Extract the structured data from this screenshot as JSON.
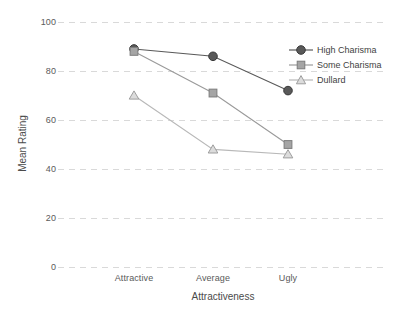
{
  "chart_data": {
    "type": "line",
    "title": "",
    "xlabel": "Attractiveness",
    "ylabel": "Mean Rating",
    "categories": [
      "Attractive",
      "Average",
      "Ugly"
    ],
    "ylim": [
      0,
      100
    ],
    "yticks": [
      0,
      20,
      40,
      60,
      80,
      100
    ],
    "grid": true,
    "legend_position": "top-right",
    "series": [
      {
        "name": "High Charisma",
        "marker": "circle-filled",
        "color": "#595959",
        "values": [
          89,
          86,
          72
        ]
      },
      {
        "name": "Some Charisma",
        "marker": "square-filled",
        "color": "#9a9a9a",
        "values": [
          88,
          71,
          50
        ]
      },
      {
        "name": "Dullard",
        "marker": "triangle-open",
        "color": "#b8b8b8",
        "values": [
          70,
          48,
          46
        ]
      }
    ]
  },
  "axes": {
    "y_tick_labels": [
      "100",
      "80",
      "60",
      "40",
      "20",
      "0"
    ],
    "x_tick_labels": [
      "Attractive",
      "Average",
      "Ugly"
    ],
    "y_title": "Mean Rating",
    "x_title": "Attractiveness"
  },
  "legend": {
    "items": [
      {
        "label": "High Charisma"
      },
      {
        "label": "Some Charisma"
      },
      {
        "label": "Dullard"
      }
    ]
  },
  "style": {
    "background": "#ffffff",
    "gridline_color": "#d9d9d9",
    "text_color": "#4d4d4d",
    "series_dark": "#595959",
    "series_mid": "#9a9a9a",
    "series_light": "#b8b8b8"
  }
}
